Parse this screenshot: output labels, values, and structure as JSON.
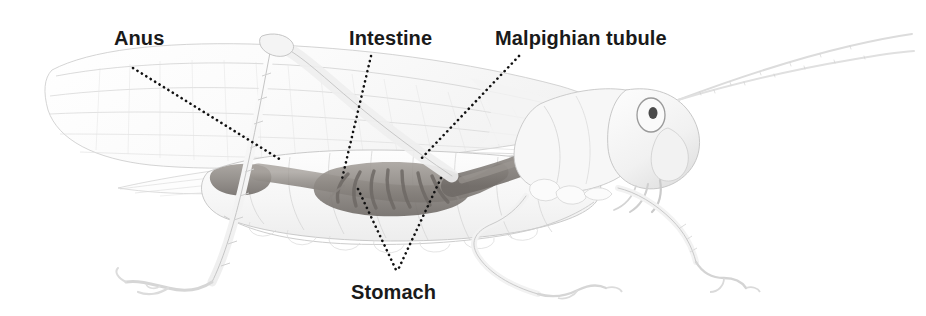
{
  "figure": {
    "width": 926,
    "height": 316,
    "background_color": "#ffffff",
    "style": "pencil-illustration-labeled-anatomy"
  },
  "labels": {
    "anus": "Anus",
    "intestine": "Intestine",
    "malpighian_tubule": "Malpighian tubule",
    "stomach": "Stomach"
  },
  "label_style": {
    "color": "#1a1a1a",
    "weight": "bold",
    "size_px": 20
  },
  "leaders": {
    "color": "#111111",
    "style": "dotted",
    "anus": "M133,68 L281,160",
    "intestine": "M371,56 L342,179",
    "malpighian_tubule": "M519,56 L419,161",
    "stomach_left": "M358,189 L397,272",
    "stomach_right": "M441,178 L397,272"
  },
  "anatomy": {
    "organ_tint": "#8f8a86",
    "body_outline": "#b9b9b9",
    "parts": [
      "forewing",
      "hindwing",
      "abdomen",
      "thorax",
      "head",
      "compound-eye",
      "antenna-upper",
      "antenna-lower",
      "hind-leg-femur",
      "hind-leg-tibia",
      "hind-leg-tarsus",
      "middle-leg",
      "front-leg",
      "crop",
      "stomach",
      "intestine",
      "malpighian-tubules",
      "rectum",
      "anus"
    ]
  }
}
